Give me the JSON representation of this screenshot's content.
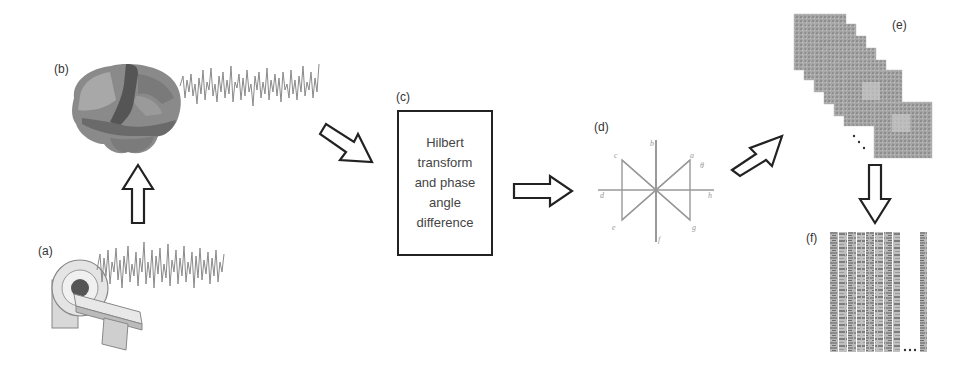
{
  "figure": {
    "panels": {
      "a": {
        "label": "(a)",
        "description": "MRI scanner with raw fMRI signal"
      },
      "b": {
        "label": "(b)",
        "description": "Brain parcellation with regional time series"
      },
      "c": {
        "label": "(c)",
        "text": "Hilbert\ntransform\nand phase\nangle\ndifference"
      },
      "d": {
        "label": "(d)",
        "description": "Phase angle diagram",
        "axis_letters": [
          "a",
          "b",
          "c",
          "d",
          "e",
          "f",
          "g",
          "h"
        ]
      },
      "e": {
        "label": "(e)",
        "description": "Stack of phase synchrony matrices",
        "ellipsis": "..."
      },
      "f": {
        "label": "(f)",
        "description": "Vectorized feature matrix",
        "ellipsis": "..."
      }
    },
    "arrows": [
      {
        "from": "a",
        "to": "b",
        "direction": "up"
      },
      {
        "from": "b",
        "to": "c",
        "direction": "down-right"
      },
      {
        "from": "c",
        "to": "d",
        "direction": "right"
      },
      {
        "from": "d",
        "to": "e",
        "direction": "up-right"
      },
      {
        "from": "e",
        "to": "f",
        "direction": "down"
      }
    ],
    "colors": {
      "stroke": "#222222",
      "signal": "#8a8a8a",
      "brain_dark": "#5a5a5a",
      "brain_mid": "#7d7d7d",
      "brain_light": "#a8a8a8",
      "matrix": "#a0a0a0"
    }
  }
}
